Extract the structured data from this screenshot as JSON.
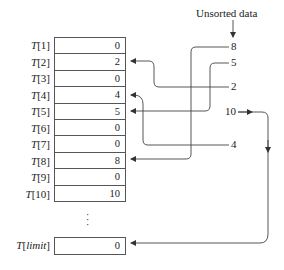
{
  "header": {
    "unsorted_label": "Unsorted data"
  },
  "array": {
    "name": "T",
    "rows": [
      {
        "index": "1",
        "value": "0"
      },
      {
        "index": "2",
        "value": "2"
      },
      {
        "index": "3",
        "value": "0"
      },
      {
        "index": "4",
        "value": "4"
      },
      {
        "index": "5",
        "value": "5"
      },
      {
        "index": "6",
        "value": "0"
      },
      {
        "index": "7",
        "value": "0"
      },
      {
        "index": "8",
        "value": "8"
      },
      {
        "index": "9",
        "value": "0"
      },
      {
        "index": "10",
        "value": "10"
      }
    ],
    "ellipsis": "⋮",
    "limit_row": {
      "index": "limit",
      "value": "0"
    }
  },
  "unsorted_values": [
    {
      "value": "8",
      "target_index": "8"
    },
    {
      "value": "5",
      "target_index": "5"
    },
    {
      "value": "2",
      "target_index": "2"
    },
    {
      "value": "10",
      "target_index": "10"
    },
    {
      "value": "4",
      "target_index": "4"
    }
  ],
  "colors": {
    "line": "#444444",
    "border": "#555555",
    "text": "#222222"
  }
}
